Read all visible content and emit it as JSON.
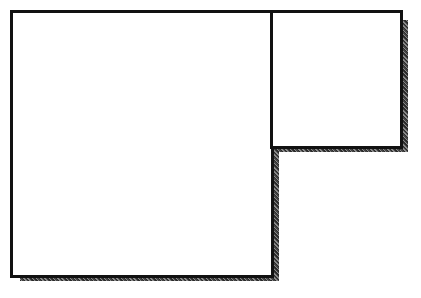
{
  "diagram": {
    "colors": {
      "stroke": "#111111",
      "fill": "#ffffff",
      "shadow": "#3a3a3a"
    },
    "panels": [
      {
        "name": "large-panel",
        "x": 10,
        "y": 10,
        "w": 262,
        "h": 268
      },
      {
        "name": "small-panel",
        "x": 270,
        "y": 10,
        "w": 132,
        "h": 139
      }
    ]
  }
}
